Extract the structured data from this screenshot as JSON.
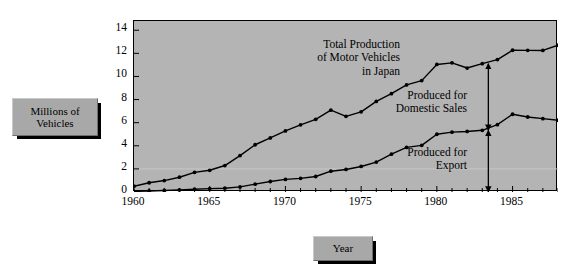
{
  "axis_label_boxes": {
    "y": {
      "line1": "Millions of",
      "line2": "Vehicles",
      "name": "millions-of-vehicles-label"
    },
    "x": {
      "line1": "Year",
      "name": "year-label"
    }
  },
  "annotations": {
    "total": {
      "line1": "Total Production",
      "line2": "of Motor Vehicles",
      "line3": "in Japan"
    },
    "domestic": {
      "line1": "Produced for",
      "line2": "Domestic Sales"
    },
    "export": {
      "line1": "Produced for",
      "line2": "Export"
    }
  },
  "chart_data": {
    "type": "line",
    "title": "Total Production of Motor Vehicles in Japan",
    "xlabel": "Year",
    "ylabel": "Millions of Vehicles",
    "xlim": [
      1960,
      1988
    ],
    "ylim": [
      0,
      14.8
    ],
    "yticks": [
      0,
      2,
      4,
      6,
      8,
      10,
      12,
      14
    ],
    "ytick_labels": [
      "0",
      "2",
      "4",
      "6",
      "8",
      "10",
      "12",
      "14"
    ],
    "xticks": [
      1960,
      1961,
      1962,
      1963,
      1964,
      1965,
      1966,
      1967,
      1968,
      1969,
      1970,
      1971,
      1972,
      1973,
      1974,
      1975,
      1976,
      1977,
      1978,
      1979,
      1980,
      1981,
      1982,
      1983,
      1984,
      1985,
      1986,
      1987,
      1988
    ],
    "xtick_labels_shown": [
      "1960",
      "1965",
      "1970",
      "1975",
      "1980",
      "1985"
    ],
    "xtick_labels_years": [
      1960,
      1965,
      1970,
      1975,
      1980,
      1985
    ],
    "grid": "single faint horizontal gridline at y=2",
    "gridlines": [
      2
    ],
    "legend": "inline annotations",
    "marker": "filled circle",
    "x": [
      1960,
      1961,
      1962,
      1963,
      1964,
      1965,
      1966,
      1967,
      1968,
      1969,
      1970,
      1971,
      1972,
      1973,
      1974,
      1975,
      1976,
      1977,
      1978,
      1979,
      1980,
      1981,
      1982,
      1983,
      1984,
      1985,
      1986,
      1987,
      1988
    ],
    "series": [
      {
        "name": "Total Production of Motor Vehicles in Japan",
        "values": [
          0.5,
          0.8,
          0.99,
          1.28,
          1.7,
          1.88,
          2.29,
          3.15,
          4.09,
          4.68,
          5.29,
          5.81,
          6.29,
          7.08,
          6.55,
          6.94,
          7.84,
          8.51,
          9.27,
          9.64,
          11.04,
          11.18,
          10.73,
          11.11,
          11.46,
          12.27,
          12.26,
          12.25,
          12.7
        ]
      },
      {
        "name": "Produced for Export",
        "values": [
          0.05,
          0.09,
          0.13,
          0.18,
          0.24,
          0.29,
          0.33,
          0.44,
          0.68,
          0.91,
          1.09,
          1.18,
          1.34,
          1.8,
          1.95,
          2.21,
          2.59,
          3.27,
          3.86,
          4.04,
          5.0,
          5.18,
          5.24,
          5.34,
          5.83,
          6.73,
          6.49,
          6.35,
          6.21
        ]
      }
    ],
    "derived_series": [
      {
        "name": "Produced for Domestic Sales",
        "note": "vertical gap between total and export curves at ~1983"
      }
    ],
    "arrows": [
      {
        "name": "domestic-sales-arrow",
        "year": 1983.4,
        "from": 5.34,
        "to": 11.11,
        "style": "double-headed"
      },
      {
        "name": "export-arrow",
        "year": 1983.4,
        "from": 0,
        "to": 5.34,
        "style": "double-headed"
      }
    ],
    "colors": {
      "plot_background": "#b4b4b4",
      "page_background": "#ffffff",
      "line": "#000000",
      "frame": "#000000",
      "label_box": "#a8a8a8",
      "label_shadow": "#000000"
    }
  }
}
